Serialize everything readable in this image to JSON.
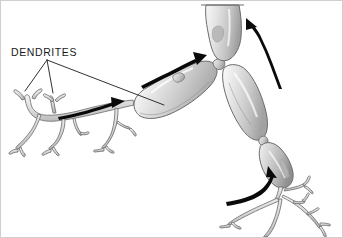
{
  "figure": {
    "background_color": "#ffffff",
    "border_color": "#cfcfcf",
    "style": "grayscale pen-and-ink anatomical illustration"
  },
  "labels": [
    {
      "id": "dendrites",
      "text": "DENDRITES",
      "x": 10,
      "y": 55,
      "color": "#1a1a1a"
    }
  ],
  "leader_lines": [
    {
      "id": "leader-fork-left",
      "from": [
        46,
        59
      ],
      "to": [
        24,
        90
      ]
    },
    {
      "id": "leader-fork-right",
      "from": [
        46,
        59
      ],
      "to": [
        52,
        92
      ]
    },
    {
      "id": "leader-soma",
      "from": [
        46,
        59
      ],
      "to": [
        163,
        104
      ]
    }
  ],
  "arrows": [
    {
      "id": "arrow-lower-left",
      "direction": "right",
      "description": "signal entering from left dendrite tree"
    },
    {
      "id": "arrow-mid-axon",
      "direction": "up-right",
      "description": "signal travelling along main segment"
    },
    {
      "id": "arrow-upper-right",
      "direction": "up",
      "description": "signal exiting toward top segment"
    },
    {
      "id": "arrow-lower-right",
      "direction": "up-right",
      "description": "signal entering from lower dendrite tree"
    }
  ],
  "structures": [
    {
      "id": "segment-top",
      "name": "top myelin segment (cut off at top edge)"
    },
    {
      "id": "segment-main",
      "name": "main elongated myelin segment"
    },
    {
      "id": "segment-right-upper",
      "name": "upper right myelin segment"
    },
    {
      "id": "segment-right-lower",
      "name": "lower right myelin segment"
    },
    {
      "id": "dendrite-tree-left",
      "name": "left branching dendrite tree"
    },
    {
      "id": "dendrite-tree-right",
      "name": "lower right branching dendrite tree"
    },
    {
      "id": "node-upper",
      "name": "node of Ranvier (upper junction)"
    },
    {
      "id": "node-lower",
      "name": "node of Ranvier (lower junction)"
    },
    {
      "id": "cut-line-top",
      "name": "truncation line at top of figure"
    }
  ],
  "colors": {
    "ink": "#1a1a1a",
    "arrow": "#0a0a0a",
    "membrane_outline": "#6b6b6b",
    "fill_light": "#f2f2f2",
    "fill_mid": "#d2d2d2",
    "fill_dark": "#9a9a9a"
  }
}
